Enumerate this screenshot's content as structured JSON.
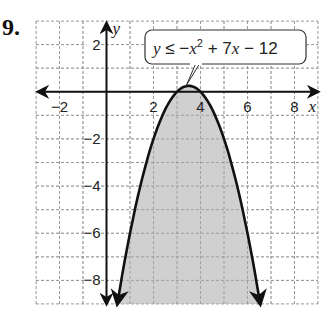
{
  "problem_number": "9.",
  "chart_data": {
    "type": "area",
    "title": "",
    "inequality": "y ≤ −x² + 7x − 12",
    "equation_parts": {
      "y": "y",
      "le": " ≤ −",
      "x1": "x",
      "sup": "2",
      "mid": " + 7",
      "x2": "x",
      "end": " − 12"
    },
    "function": {
      "a": -1,
      "b": 7,
      "c": -12
    },
    "vertex": [
      3.5,
      0.25
    ],
    "roots": [
      3,
      4
    ],
    "boundary": "solid",
    "shaded_region": "below curve",
    "xlabel": "x",
    "ylabel": "y",
    "xlim": [
      -3,
      9
    ],
    "ylim": [
      -9,
      3
    ],
    "x_ticks": [
      {
        "v": -2,
        "label": "−2"
      },
      {
        "v": 2,
        "label": "2"
      },
      {
        "v": 4,
        "label": "4"
      },
      {
        "v": 6,
        "label": "6"
      },
      {
        "v": 8,
        "label": "8"
      }
    ],
    "y_ticks": [
      {
        "v": 2,
        "label": "2"
      },
      {
        "v": -2,
        "label": "−2"
      },
      {
        "v": -4,
        "label": "−4"
      },
      {
        "v": -6,
        "label": "−6"
      },
      {
        "v": -8,
        "label": "−8"
      }
    ],
    "grid": true,
    "colors": {
      "shade": "#c8c8c8",
      "curve": "#111111",
      "grid": "#9a9a9a",
      "axis": "#111111"
    }
  }
}
